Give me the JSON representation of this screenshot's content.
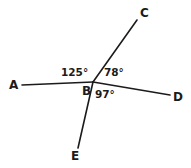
{
  "figure": {
    "type": "geometry-angle-diagram",
    "background_color": "#ffffff",
    "stroke_color": "#1b1b1b",
    "text_color": "#1b1b1b",
    "width": 191,
    "height": 168,
    "vertex": {
      "label": "B",
      "x": 93,
      "y": 82
    },
    "rays": [
      {
        "label": "A",
        "from": [
          93,
          82
        ],
        "to": [
          22,
          85
        ],
        "endpoint_label_x": 9,
        "endpoint_label_y": 79
      },
      {
        "label": "C",
        "from": [
          93,
          82
        ],
        "to": [
          137,
          20
        ],
        "endpoint_label_x": 140,
        "endpoint_label_y": 7
      },
      {
        "label": "D",
        "from": [
          93,
          82
        ],
        "to": [
          170,
          95
        ],
        "endpoint_label_x": 173,
        "endpoint_label_y": 91
      },
      {
        "label": "E",
        "from": [
          93,
          82
        ],
        "to": [
          78,
          148
        ],
        "endpoint_label_x": 71,
        "endpoint_label_y": 150
      }
    ],
    "point_labels": {
      "a": "A",
      "b": "B",
      "c": "C",
      "d": "D",
      "e": "E"
    },
    "angle_labels": {
      "abc": "125°",
      "cbd": "78°",
      "dbe": "97°"
    },
    "angle_values": {
      "abc": 125,
      "cbd": 78,
      "dbe": 97
    }
  }
}
